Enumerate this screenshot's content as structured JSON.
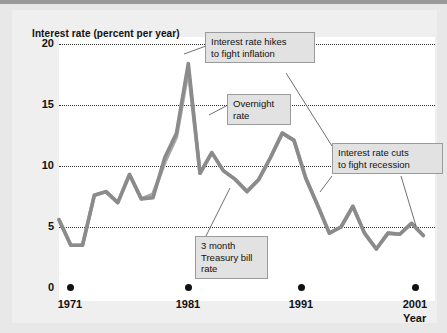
{
  "chart_data": {
    "type": "line",
    "title": "Interest rate (percent per year)",
    "ylabel": "Interest rate (percent per year)",
    "xlabel": "Year",
    "ylim": [
      0,
      20
    ],
    "xlim": [
      1970,
      2002
    ],
    "grid": true,
    "grid_style": "dotted horizontal",
    "legend": "none (labeled via callouts)",
    "y_ticks": [
      "0",
      "5",
      "10",
      "15",
      "20"
    ],
    "y_tick_values": [
      0,
      5,
      10,
      15,
      20
    ],
    "x_ticks": [
      "1971",
      "1981",
      "1991",
      "2001"
    ],
    "x_tick_values": [
      1971,
      1981,
      1991,
      2001
    ],
    "line_color": "#8b8b8b",
    "line_color_secondary": "#a9a9a9",
    "series": [
      {
        "name": "Overnight rate",
        "x": [
          1970,
          1971,
          1972,
          1973,
          1974,
          1975,
          1976,
          1977,
          1978,
          1979,
          1980,
          1981,
          1982,
          1983,
          1984,
          1985,
          1986,
          1987,
          1988,
          1989,
          1990,
          1991,
          1992,
          1993,
          1994,
          1995,
          1996,
          1997,
          1998,
          1999,
          2000,
          2001
        ],
        "values": [
          5.6,
          3.5,
          3.5,
          7.6,
          7.9,
          7.0,
          9.3,
          7.3,
          7.4,
          10.7,
          12.7,
          18.4,
          9.4,
          11.1,
          9.6,
          8.9,
          7.9,
          8.9,
          10.7,
          12.7,
          12.1,
          9.0,
          6.8,
          4.5,
          5.0,
          6.7,
          4.5,
          3.2,
          4.5,
          4.4,
          5.3,
          4.3
        ]
      },
      {
        "name": "3 month Treasury bill rate",
        "x": [
          1970,
          1971,
          1972,
          1973,
          1974,
          1975,
          1976,
          1977,
          1978,
          1979,
          1980,
          1981,
          1982,
          1983,
          1984,
          1985,
          1986,
          1987,
          1988,
          1989,
          1990,
          1991,
          1992,
          1993,
          1994,
          1995,
          1996,
          1997,
          1998,
          1999,
          2000,
          2001
        ],
        "values": [
          5.6,
          3.5,
          3.5,
          7.6,
          7.9,
          7.0,
          9.3,
          7.3,
          7.7,
          10.3,
          12.4,
          17.9,
          9.4,
          11.1,
          9.6,
          8.9,
          7.9,
          8.9,
          10.7,
          12.7,
          12.1,
          9.0,
          6.8,
          4.5,
          5.0,
          6.7,
          4.5,
          3.2,
          4.5,
          4.4,
          5.3,
          4.3
        ]
      }
    ],
    "annotations": [
      {
        "id": "hikes",
        "text": "Interest rate hikes\nto fight inflation"
      },
      {
        "id": "overnight",
        "text": "Overnight\nrate"
      },
      {
        "id": "tbill",
        "text": "3 month\nTreasury bill\nrate"
      },
      {
        "id": "cuts",
        "text": "Interest rate cuts\nto fight recession"
      }
    ]
  },
  "axes": {
    "y_title": "Interest rate (percent per year)",
    "x_title": "Year",
    "y_ticks": [
      {
        "label": "20"
      },
      {
        "label": "15"
      },
      {
        "label": "10"
      },
      {
        "label": "5"
      },
      {
        "label": "0"
      }
    ],
    "x_ticks": [
      {
        "label": "1971"
      },
      {
        "label": "1981"
      },
      {
        "label": "1991"
      },
      {
        "label": "2001"
      }
    ]
  },
  "callouts": {
    "hikes": "Interest rate hikes\nto fight inflation",
    "overnight": "Overnight\nrate",
    "tbill": "3 month\nTreasury bill\nrate",
    "cuts": "Interest rate cuts\nto fight recession"
  },
  "colors": {
    "line": "#8b8b8b",
    "line_secondary": "#a9a9a9",
    "page_background": "#e8e8e8",
    "figure_background": "#efefef",
    "canvas": "#ffffff",
    "callout_fill": "#e2e2e2",
    "callout_border": "#9b9b9b",
    "text": "#111111"
  }
}
